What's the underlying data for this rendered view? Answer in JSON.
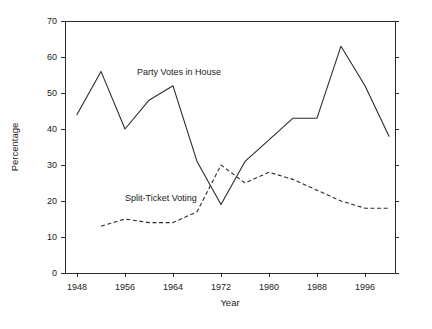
{
  "chart_data": {
    "type": "line",
    "title": "",
    "xlabel": "Year",
    "ylabel": "Percentage",
    "xlim": [
      1946,
      2001
    ],
    "ylim": [
      0,
      70
    ],
    "grid": false,
    "legend_position": "inline-annotations",
    "xticks": [
      1948,
      1956,
      1964,
      1972,
      1980,
      1988,
      1996
    ],
    "xtick_labels": [
      "1948",
      "1956",
      "1964",
      "1972",
      "1980",
      "1988",
      "1996"
    ],
    "yticks": [
      0,
      10,
      20,
      30,
      40,
      50,
      60,
      70
    ],
    "ytick_labels": [
      "0",
      "10",
      "20",
      "30",
      "40",
      "50",
      "60",
      "70"
    ],
    "series": [
      {
        "name": "Party Votes in House",
        "style": "solid",
        "annotation": "Party Votes in House",
        "x": [
          1948,
          1952,
          1956,
          1960,
          1964,
          1968,
          1972,
          1976,
          1980,
          1984,
          1988,
          1992,
          1996,
          2000
        ],
        "values": [
          44,
          56,
          40,
          48,
          52,
          31,
          19,
          31,
          37,
          43,
          43,
          63,
          52,
          38
        ]
      },
      {
        "name": "Split-Ticket Voting",
        "style": "dashed",
        "annotation": "Split-Ticket Voting",
        "x": [
          1952,
          1956,
          1960,
          1964,
          1968,
          1972,
          1976,
          1980,
          1984,
          1988,
          1992,
          1996,
          2000
        ],
        "values": [
          13,
          15,
          14,
          14,
          17,
          30,
          25,
          28,
          26,
          23,
          20,
          18,
          18
        ]
      }
    ],
    "annotations": [
      {
        "text": "Party Votes in House",
        "x": 1958,
        "y": 55
      },
      {
        "text": "Split-Ticket Voting",
        "x": 1956,
        "y": 20
      }
    ]
  }
}
